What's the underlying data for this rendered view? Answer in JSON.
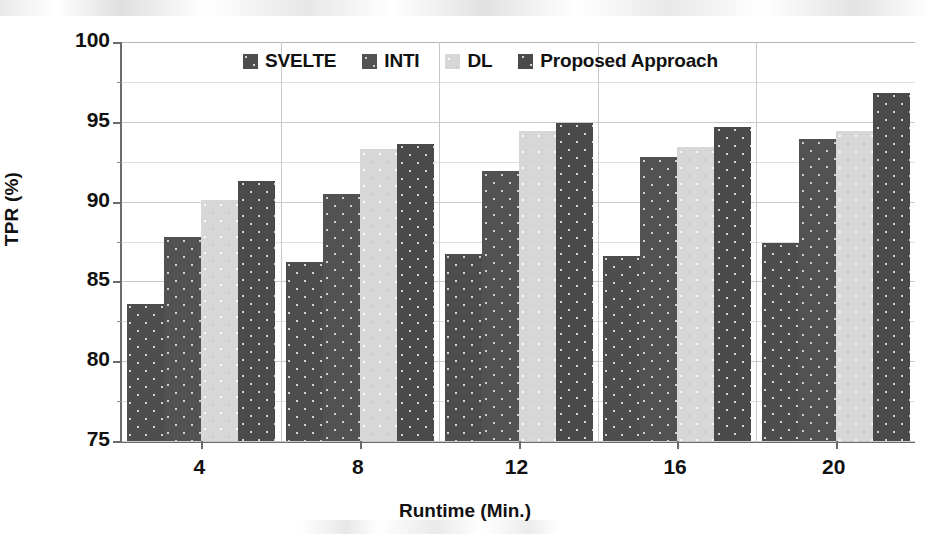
{
  "chart_data": {
    "type": "bar",
    "title": "",
    "xlabel": "Runtime (Min.)",
    "ylabel": "TPR (%)",
    "categories": [
      "4",
      "8",
      "12",
      "16",
      "20"
    ],
    "series": [
      {
        "name": "SVELTE",
        "values": [
          83.6,
          86.2,
          86.7,
          86.6,
          87.4
        ],
        "color": "#4d4d4d"
      },
      {
        "name": "INTI",
        "values": [
          87.8,
          90.5,
          91.9,
          92.8,
          93.9
        ],
        "color": "#525252"
      },
      {
        "name": "DL",
        "values": [
          90.1,
          93.3,
          94.4,
          93.4,
          94.4
        ],
        "color": "#d7d7d7"
      },
      {
        "name": "Proposed Approach",
        "values": [
          91.3,
          93.6,
          94.9,
          94.7,
          96.8
        ],
        "color": "#4a4a4a"
      }
    ],
    "ylim": [
      75,
      100
    ],
    "yticks": [
      75,
      80,
      85,
      90,
      95,
      100
    ],
    "ytick_labels": [
      "75",
      "80",
      "85",
      "90",
      "95",
      "100"
    ],
    "yminor_step": 2.5,
    "grid": true,
    "legend_position": "top-center"
  },
  "legend": {
    "items": [
      {
        "label": "SVELTE",
        "swatch": "legend-swatch-svelte"
      },
      {
        "label": "INTI",
        "swatch": "legend-swatch-inti"
      },
      {
        "label": "DL",
        "swatch": "legend-swatch-dl"
      },
      {
        "label": "Proposed Approach",
        "swatch": "legend-swatch-proposed"
      }
    ]
  }
}
